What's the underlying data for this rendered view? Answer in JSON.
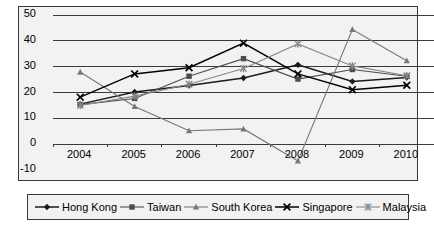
{
  "chart_data": {
    "type": "line",
    "title": "",
    "xlabel": "",
    "ylabel": "",
    "categories": [
      "2004",
      "2005",
      "2006",
      "2007",
      "2008",
      "2009",
      "2010"
    ],
    "ylim": [
      -10,
      50
    ],
    "yticks": [
      "50",
      "40",
      "30",
      "20",
      "10",
      "0",
      "-10"
    ],
    "ytick_values": [
      50,
      40,
      30,
      20,
      10,
      0,
      -10
    ],
    "grid": true,
    "grid_axis": "y",
    "legend_position": "bottom",
    "series": [
      {
        "name": "Hong Kong",
        "marker": "diamond",
        "color": "#1a1a1a",
        "values": [
          15.5,
          20.2,
          22.7,
          25.6,
          30.7,
          24.3,
          25.8
        ]
      },
      {
        "name": "Taiwan",
        "marker": "square",
        "color": "#4d4d4d",
        "values": [
          15.3,
          17.7,
          26.3,
          33.1,
          25.2,
          28.9,
          26.3
        ]
      },
      {
        "name": "South Korea",
        "marker": "triangle",
        "color": "#777777",
        "values": [
          27.9,
          14.6,
          5.2,
          5.9,
          -6.5,
          44.4,
          32.3
        ]
      },
      {
        "name": "Singapore",
        "marker": "cross",
        "color": "#000000",
        "values": [
          18.2,
          27.2,
          29.6,
          39.1,
          27.2,
          21.1,
          22.8
        ]
      },
      {
        "name": "Malaysia",
        "marker": "asterisk",
        "color": "#888888",
        "values": [
          15.0,
          18.6,
          23.2,
          29.3,
          38.8,
          30.3,
          26.5
        ]
      }
    ]
  },
  "legend": {
    "items": [
      {
        "label": "Hong Kong"
      },
      {
        "label": "Taiwan"
      },
      {
        "label": "South Korea"
      },
      {
        "label": "Singapore"
      },
      {
        "label": "Malaysia"
      }
    ]
  }
}
